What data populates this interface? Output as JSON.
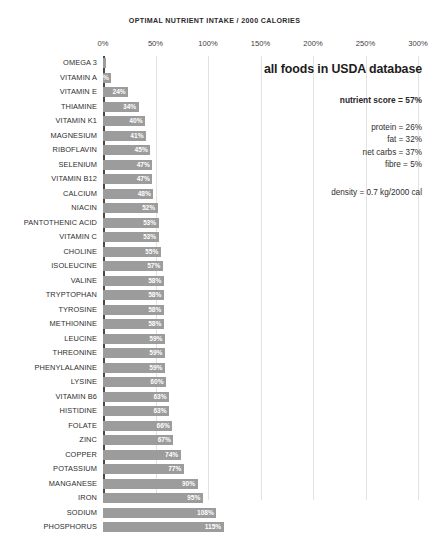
{
  "chart_data": {
    "type": "bar",
    "orientation": "horizontal",
    "title": "OPTIMAL  NUTRIENT INTAKE / 2000 CALORIES",
    "xlabel": "",
    "ylabel": "",
    "xlim": [
      0,
      300
    ],
    "grid": true,
    "tick_labels": [
      "0%",
      "50%",
      "100%",
      "150%",
      "200%",
      "250%",
      "300%"
    ],
    "tick_values": [
      0,
      50,
      100,
      150,
      200,
      250,
      300
    ],
    "bar_color": "#9c9c9c",
    "axis_color": "#4a4849",
    "grid_color": "#e2e2e2",
    "value_label_unit": "%",
    "categories": [
      "OMEGA 3",
      "VITAMIN A",
      "VITAMIN E",
      "THIAMINE",
      "VITAMIN K1",
      "MAGNESIUM",
      "RIBOFLAVIN",
      "SELENIUM",
      "VITAMIN B12",
      "CALCIUM",
      "NIACIN",
      "PANTOTHENIC ACID",
      "VITAMIN C",
      "CHOLINE",
      "ISOLEUCINE",
      "VALINE",
      "TRYPTOPHAN",
      "TYROSINE",
      "METHIONINE",
      "LEUCINE",
      "THREONINE",
      "PHENYLALANINE",
      "LYSINE",
      "VITAMIN B6",
      "HISTIDINE",
      "FOLATE",
      "ZINC",
      "COPPER",
      "POTASSIUM",
      "MANGANESE",
      "IRON",
      "SODIUM",
      "PHOSPHORUS"
    ],
    "values": [
      3,
      8,
      24,
      34,
      40,
      41,
      45,
      47,
      47,
      48,
      52,
      53,
      53,
      55,
      57,
      58,
      58,
      58,
      58,
      59,
      59,
      59,
      60,
      63,
      63,
      66,
      67,
      74,
      77,
      90,
      95,
      108,
      115
    ],
    "value_labels": [
      "",
      "8%",
      "24%",
      "34%",
      "40%",
      "41%",
      "45%",
      "47%",
      "47%",
      "48%",
      "52%",
      "53%",
      "53%",
      "55%",
      "57%",
      "58%",
      "58%",
      "58%",
      "58%",
      "59%",
      "59%",
      "59%",
      "60%",
      "63%",
      "63%",
      "66%",
      "67%",
      "74%",
      "77%",
      "90%",
      "95%",
      "108%",
      "115%"
    ]
  },
  "annotations": {
    "heading": "all foods in USDA database",
    "nutrient_score": "nutrient score = 57%",
    "macros": [
      "protein = 26%",
      "fat = 32%",
      "net carbs = 37%",
      "fibre = 5%"
    ],
    "density": "density = 0.7 kg/2000 cal"
  }
}
